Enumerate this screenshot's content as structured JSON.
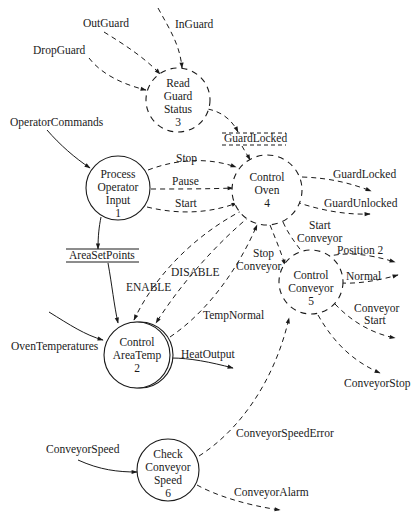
{
  "diagram": {
    "type": "data-flow-diagram",
    "colors": {
      "stroke": "#1a1a1a",
      "background": "#ffffff"
    },
    "processes": [
      {
        "id": "3",
        "lines": [
          "Read",
          "Guard",
          "Status",
          "3"
        ],
        "style": "dashed"
      },
      {
        "id": "1",
        "lines": [
          "Process",
          "Operator",
          "Input",
          "1"
        ],
        "style": "solid"
      },
      {
        "id": "4",
        "lines": [
          "Control",
          "Oven",
          "4"
        ],
        "style": "dashed"
      },
      {
        "id": "5",
        "lines": [
          "Control",
          "Conveyor",
          "5"
        ],
        "style": "dashed"
      },
      {
        "id": "2",
        "lines": [
          "Control",
          "AreaTemp",
          "2"
        ],
        "style": "double-solid"
      },
      {
        "id": "6",
        "lines": [
          "Check",
          "Conveyor",
          "Speed",
          "6"
        ],
        "style": "solid"
      }
    ],
    "stores": {
      "guard_locked": "GuardLocked",
      "area_set_points": "AreaSetPoints"
    },
    "flows": {
      "out_guard": "OutGuard",
      "in_guard": "InGuard",
      "drop_guard": "DropGuard",
      "operator_commands": "OperatorCommands",
      "stop": "Stop",
      "pause": "Pause",
      "start": "Start",
      "guard_locked_out": "GuardLocked",
      "guard_unlocked_out": "GuardUnlocked",
      "start_conveyor_1": "Start",
      "start_conveyor_2": "Conveyor",
      "position_2": "Position 2",
      "normal": "Normal",
      "conveyor_start_1": "Conveyor",
      "conveyor_start_2": "Start",
      "conveyor_stop": "ConveyorStop",
      "disable": "DISABLE",
      "enable": "ENABLE",
      "stop_conveyor_1": "Stop",
      "stop_conveyor_2": "Conveyor",
      "temp_normal": "TempNormal",
      "oven_temperatures": "OvenTemperatures",
      "heat_output": "HeatOutput",
      "conveyor_speed_error": "ConveyorSpeedError",
      "conveyor_speed": "ConveyorSpeed",
      "conveyor_alarm": "ConveyorAlarm"
    }
  }
}
